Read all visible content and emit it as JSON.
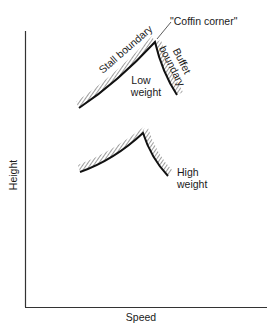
{
  "figure": {
    "axes": {
      "x_label": "Speed",
      "y_label": "Height"
    },
    "annotations": {
      "coffin_corner": "\"Coffin corner\"",
      "stall_boundary": "Stall boundary",
      "buffet_boundary_line1": "Buffet",
      "buffet_boundary_line2": "boundary",
      "low_weight_line1": "Low",
      "low_weight_line2": "weight",
      "high_weight_line1": "High",
      "high_weight_line2": "weight"
    },
    "envelopes": [
      {
        "name": "Low weight",
        "stall_start": [
          79,
          108
        ],
        "peak": [
          155,
          42
        ],
        "buffet_end": [
          177,
          95
        ]
      },
      {
        "name": "High weight",
        "stall_start": [
          80,
          172
        ],
        "peak": [
          143,
          133
        ],
        "buffet_end": [
          168,
          176
        ]
      }
    ],
    "colors": {
      "line": "#111111",
      "background": "#ffffff"
    }
  }
}
